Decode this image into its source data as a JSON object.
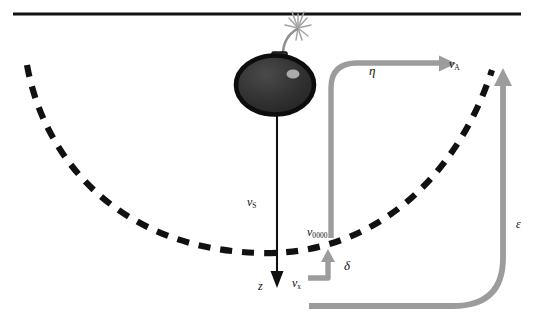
{
  "figure": {
    "domain": "diagram",
    "background_color": "#ffffff",
    "surface_line": {
      "name": "water-surface-line",
      "color": "#111111",
      "x_start": 13,
      "x_end": 521,
      "y": 14,
      "thickness": 3
    },
    "bomb": {
      "name": "bomb-icon",
      "body_color": "#2b2b2b",
      "outline_color": "#111111",
      "highlight_color": "#b9b9b9",
      "fuse_color": "#9a9a9a",
      "spark_color": "#a8a8a8",
      "center_x": 275,
      "center_y": 83,
      "radius_x": 38,
      "radius_y": 29
    },
    "dashed_curve": {
      "name": "shock-front-dashed-curve",
      "color": "#111111",
      "dash": "11 9",
      "thickness": 6,
      "description": "parabolic dashed arc opening upward"
    },
    "colors": {
      "ink": "#111111",
      "gray_arrow": "#9c9c9c",
      "gray_arrow_dark": "#8e8e8e",
      "bomb_body": "#2b2b2b"
    }
  },
  "labels": {
    "v_s": {
      "base": "v",
      "sub": "S",
      "name": "label-v-s"
    },
    "z": {
      "base": "z",
      "sub": "",
      "name": "label-z"
    },
    "eta": {
      "base": "η",
      "sub": "",
      "name": "label-eta"
    },
    "v_a": {
      "base": "v",
      "sub": "A",
      "name": "label-v-a"
    },
    "v_zero": {
      "base": "v",
      "sub": "0000",
      "name": "label-v-zero"
    },
    "delta": {
      "base": "δ",
      "sub": "",
      "name": "label-delta"
    },
    "v_x": {
      "base": "v",
      "sub": "x",
      "name": "label-v-x"
    },
    "epsilon": {
      "base": "ε",
      "sub": "",
      "name": "label-epsilon"
    }
  },
  "arrows": {
    "vs_arrow": {
      "name": "vertical-velocity-arrow",
      "color": "#111111",
      "from": [
        277,
        116
      ],
      "to": [
        277,
        287
      ],
      "direction": "down"
    },
    "eta_arrow": {
      "name": "eta-flow-arrow",
      "color": "#9c9c9c",
      "direction": "right",
      "tip": [
        452,
        68
      ]
    },
    "delta_arrow": {
      "name": "delta-flow-arrow",
      "color": "#9c9c9c",
      "direction": "up",
      "tip": [
        334,
        252
      ]
    },
    "epsilon_arrow": {
      "name": "epsilon-flow-arrow",
      "color": "#9c9c9c",
      "direction": "up",
      "tip": [
        503,
        71
      ]
    }
  }
}
